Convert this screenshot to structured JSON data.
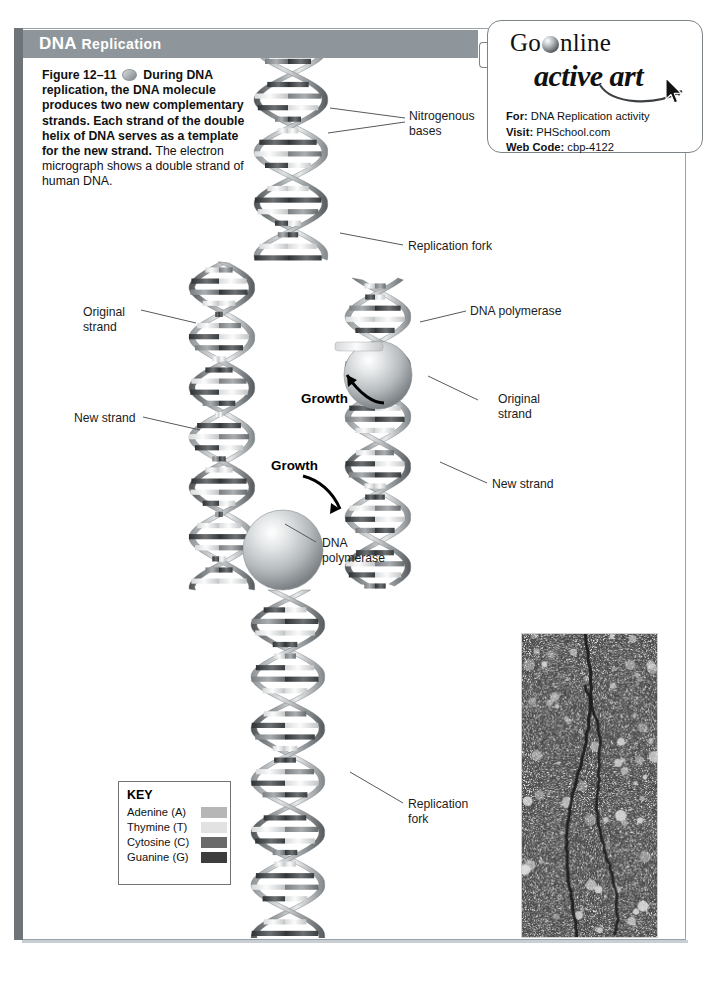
{
  "header": {
    "title_main": "DNA",
    "title_rest": "Replication"
  },
  "caption": {
    "figure_number": "Figure 12–11",
    "icon": "active-art-dot",
    "text_bold": "During DNA replication, the DNA molecule produces two new complementary strands. Each strand of the double helix of DNA serves as a template for the new strand.",
    "text_plain": "The electron micrograph shows a double strand of human DNA."
  },
  "go_online": {
    "wordmark_go": "Go",
    "wordmark_online": "nline",
    "wordmark_active_art": "active art",
    "for_label": "For:",
    "for_value": "DNA Replication activity",
    "visit_label": "Visit:",
    "visit_value": "PHSchool.com",
    "webcode_label": "Web Code:",
    "webcode_value": "cbp-4122"
  },
  "callouts": [
    {
      "id": "nitrogenous-bases",
      "line1": "Nitrogenous",
      "line2": "bases"
    },
    {
      "id": "replication-fork-top",
      "line1": "Replication fork",
      "line2": ""
    },
    {
      "id": "dna-polymerase-right",
      "line1": "DNA polymerase",
      "line2": ""
    },
    {
      "id": "original-strand-right",
      "line1": "Original",
      "line2": "strand"
    },
    {
      "id": "new-strand-right",
      "line1": "New strand",
      "line2": ""
    },
    {
      "id": "replication-fork-bottom",
      "line1": "Replication",
      "line2": "fork"
    },
    {
      "id": "original-strand-left",
      "line1": "Original",
      "line2": "strand"
    },
    {
      "id": "new-strand-left",
      "line1": "New strand",
      "line2": ""
    },
    {
      "id": "dna-polymerase-left",
      "line1": "DNA",
      "line2": "polymerase"
    }
  ],
  "growth_labels": [
    {
      "id": "growth-upper",
      "text": "Growth",
      "direction": "up-left"
    },
    {
      "id": "growth-lower",
      "text": "Growth",
      "direction": "down-right"
    }
  ],
  "key": {
    "title": "KEY",
    "items": [
      {
        "label": "Adenine (A)",
        "color": "#b6b6b6"
      },
      {
        "label": "Thymine (T)",
        "color": "#e2e2e2"
      },
      {
        "label": "Cytosine (C)",
        "color": "#6a6a6a"
      },
      {
        "label": "Guanine (G)",
        "color": "#3d3d3d"
      }
    ]
  },
  "colors": {
    "header_band": "#8f969b",
    "page_border": "#9aa3a8",
    "left_edge_bar": "#6f7479",
    "leader_line": "#555a5d",
    "micrograph_bg": "#7c7c7c"
  }
}
